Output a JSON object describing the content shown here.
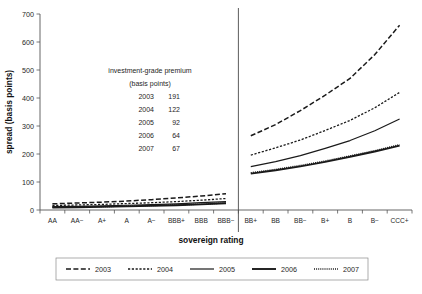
{
  "chart_data": {
    "type": "line",
    "title": "",
    "xlabel": "sovereign rating",
    "ylabel": "spread (basis points)",
    "ylim": [
      0,
      700
    ],
    "ytick_labels": [
      "0",
      "100",
      "200",
      "300",
      "400",
      "500",
      "600",
      "700"
    ],
    "ytick_values": [
      0,
      100,
      200,
      300,
      400,
      500,
      600,
      700
    ],
    "grid": false,
    "legend_position": "bottom",
    "categories": [
      "AA",
      "AA−",
      "A+",
      "A",
      "A−",
      "BBB+",
      "BBB",
      "BBB−",
      "BB+",
      "BB",
      "BB−",
      "B+",
      "B",
      "B−",
      "CCC+"
    ],
    "divider_after_category": "BBB−",
    "series": [
      {
        "name": "2003",
        "style": "long-dash",
        "values": [
          22,
          25,
          28,
          32,
          37,
          43,
          50,
          58,
          265,
          305,
          355,
          410,
          470,
          555,
          660
        ]
      },
      {
        "name": "2004",
        "style": "short-dash",
        "values": [
          16,
          18,
          20,
          23,
          26,
          30,
          35,
          41,
          196,
          222,
          250,
          284,
          320,
          365,
          420
        ]
      },
      {
        "name": "2005",
        "style": "solid",
        "values": [
          12,
          13,
          15,
          17,
          19,
          22,
          26,
          30,
          155,
          173,
          194,
          220,
          248,
          283,
          325
        ]
      },
      {
        "name": "2006",
        "style": "solid-thick",
        "values": [
          9,
          10,
          11,
          13,
          15,
          17,
          20,
          24,
          130,
          142,
          156,
          172,
          190,
          209,
          230
        ]
      },
      {
        "name": "2007",
        "style": "dotted",
        "values": [
          10,
          11,
          12,
          14,
          16,
          18,
          21,
          25,
          133,
          145,
          159,
          175,
          193,
          212,
          233
        ]
      }
    ],
    "annotation": {
      "title": "investment-grade premium",
      "subtitle": "(basis points)",
      "rows": [
        {
          "year": "2003",
          "value": "191"
        },
        {
          "year": "2004",
          "value": "122"
        },
        {
          "year": "2005",
          "value": "92"
        },
        {
          "year": "2006",
          "value": "64"
        },
        {
          "year": "2007",
          "value": "67"
        }
      ]
    },
    "legend": [
      {
        "label": "2003",
        "style": "long-dash"
      },
      {
        "label": "2004",
        "style": "short-dash"
      },
      {
        "label": "2005",
        "style": "solid"
      },
      {
        "label": "2006",
        "style": "solid-thick"
      },
      {
        "label": "2007",
        "style": "dotted"
      }
    ],
    "colors": {
      "line": "#1a1a1a",
      "axis": "#555555",
      "text": "#262626"
    }
  },
  "source_note": ""
}
